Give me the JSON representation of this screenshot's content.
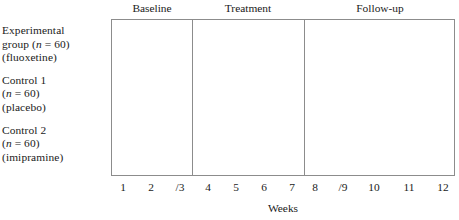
{
  "figure": {
    "axis_title": "Weeks",
    "line_color": "#8c8c8c",
    "text_color": "#1a1a1a"
  },
  "groups": [
    {
      "name": "experimental-group",
      "lines": [
        {
          "pre": "Experimental",
          "italic": "",
          "post": ""
        },
        {
          "pre": "group (",
          "italic": "n",
          "post": " = 60)"
        },
        {
          "pre": "(fluoxetine)",
          "italic": "",
          "post": ""
        }
      ]
    },
    {
      "name": "control-1-group",
      "lines": [
        {
          "pre": "Control 1",
          "italic": "",
          "post": ""
        },
        {
          "pre": "(",
          "italic": "n",
          "post": " = 60)"
        },
        {
          "pre": "(placebo)",
          "italic": "",
          "post": ""
        }
      ]
    },
    {
      "name": "control-2-group",
      "lines": [
        {
          "pre": "Control 2",
          "italic": "",
          "post": ""
        },
        {
          "pre": "(",
          "italic": "n",
          "post": " = 60)"
        },
        {
          "pre": "(imipramine)",
          "italic": "",
          "post": ""
        }
      ]
    }
  ],
  "phases": [
    {
      "label": "Baseline",
      "center_x": 152,
      "divider_x": null
    },
    {
      "label": "Treatment",
      "center_x": 248,
      "divider_x": 192
    },
    {
      "label": "Follow-up",
      "center_x": 380,
      "divider_x": 304
    }
  ],
  "weeks": [
    {
      "label": "1",
      "x": 123
    },
    {
      "label": "2",
      "x": 151
    },
    {
      "label": "/3",
      "x": 180
    },
    {
      "label": "4",
      "x": 208
    },
    {
      "label": "5",
      "x": 236
    },
    {
      "label": "6",
      "x": 264
    },
    {
      "label": "7",
      "x": 292
    },
    {
      "label": "8",
      "x": 315
    },
    {
      "label": "/9",
      "x": 343
    },
    {
      "label": "10",
      "x": 374
    },
    {
      "label": "11",
      "x": 409
    },
    {
      "label": "12",
      "x": 443
    }
  ],
  "chart_data": {
    "type": "table",
    "title": "",
    "xlabel": "Weeks",
    "ylabel": "",
    "x_tick_labels": [
      "1",
      "2",
      "/3",
      "4",
      "5",
      "6",
      "7",
      "8",
      "/9",
      "10",
      "11",
      "12"
    ],
    "xlim": [
      1,
      12
    ],
    "grid": false,
    "legend": "none",
    "categories": [
      "Baseline",
      "Treatment",
      "Follow-up"
    ],
    "phase_week_ranges": [
      [
        1,
        3
      ],
      [
        4,
        7
      ],
      [
        8,
        12
      ]
    ],
    "rows": [
      "Experimental group (n = 60) (fluoxetine)",
      "Control 1 (n = 60) (placebo)",
      "Control 2 (n = 60) (imipramine)"
    ],
    "values": [
      3,
      4,
      5
    ]
  }
}
